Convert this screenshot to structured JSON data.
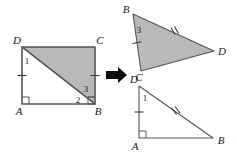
{
  "figure": {
    "arrow": {
      "name": "transform-arrow",
      "direction": "right",
      "color": "#0d0d0d"
    },
    "colors": {
      "shaded_fill": "#b9b9b9",
      "plain_fill": "#ffffff",
      "stroke": "#55555a",
      "label": "#1a1a1a"
    },
    "left_figure": {
      "name": "rectangle-abcd",
      "vertices": [
        {
          "id": "D",
          "label": "D",
          "x": 22,
          "y": 47
        },
        {
          "id": "C",
          "label": "C",
          "x": 95,
          "y": 47
        },
        {
          "id": "B",
          "label": "B",
          "x": 95,
          "y": 104
        },
        {
          "id": "A",
          "label": "A",
          "x": 22,
          "y": 104
        }
      ],
      "diagonal": {
        "from": "D",
        "to": "B"
      },
      "shaded_triangle": [
        "D",
        "C",
        "B"
      ],
      "angle_labels": [
        {
          "id": "1",
          "label": "1",
          "x": 27,
          "y": 63
        },
        {
          "id": "2",
          "label": "2",
          "x": 78,
          "y": 101
        },
        {
          "id": "3",
          "label": "3",
          "x": 86,
          "y": 89
        }
      ],
      "tick_sides": [
        "AD",
        "CB"
      ],
      "right_angles": [
        "A",
        "B"
      ]
    },
    "top_right_figure": {
      "name": "triangle-bcd-shaded",
      "vertices": [
        {
          "id": "B",
          "label": "B",
          "x": 133,
          "y": 14
        },
        {
          "id": "C",
          "label": "C",
          "x": 141,
          "y": 71
        },
        {
          "id": "D",
          "label": "D",
          "x": 214,
          "y": 51
        }
      ],
      "shaded": true,
      "angle_labels": [
        {
          "id": "3",
          "label": "3",
          "x": 139,
          "y": 30
        }
      ],
      "tick_sides": [
        "BC"
      ],
      "hash_sides": [
        "BD"
      ]
    },
    "bottom_right_figure": {
      "name": "triangle-dab-plain",
      "vertices": [
        {
          "id": "D",
          "label": "D",
          "x": 139,
          "y": 86
        },
        {
          "id": "A",
          "label": "A",
          "x": 139,
          "y": 138
        },
        {
          "id": "B",
          "label": "B",
          "x": 213,
          "y": 138
        }
      ],
      "shaded": false,
      "angle_labels": [
        {
          "id": "1",
          "label": "1",
          "x": 144,
          "y": 99
        }
      ],
      "tick_sides": [
        "DA"
      ],
      "hash_sides": [
        "DB"
      ],
      "right_angles": [
        "A"
      ]
    }
  }
}
